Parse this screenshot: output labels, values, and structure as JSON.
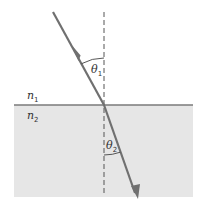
{
  "diagram": {
    "labels": {
      "n1": {
        "base": "n",
        "sub": "1"
      },
      "n2": {
        "base": "n",
        "sub": "2"
      },
      "theta1": {
        "base": "θ",
        "sub": "1"
      },
      "theta2": {
        "base": "θ",
        "sub": "2"
      }
    },
    "colors": {
      "ray": "#707070",
      "medium2_fill": "#e6e6e6",
      "interface": "#7a7a7a",
      "normal": "#555555",
      "background": "#ffffff"
    },
    "geometry": {
      "medium2": {
        "x": 14,
        "y": 105,
        "width": 179,
        "height": 92
      },
      "interface_y": 105,
      "normal_x": 104,
      "normal_y_top": 12,
      "normal_y_bottom": 196,
      "incident_ray": {
        "x1": 53,
        "y1": 12,
        "x2": 104,
        "y2": 105
      },
      "refracted_ray": {
        "x1": 104,
        "y1": 105,
        "x2": 137,
        "y2": 199
      }
    }
  }
}
